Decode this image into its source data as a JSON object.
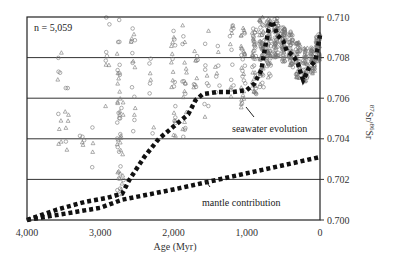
{
  "chart_data": {
    "type": "scatter",
    "title": "",
    "xlabel": "Age (Myr)",
    "ylabel": "87Sr/86Sr",
    "ylabel_display": {
      "sup1": "87",
      "base1": "Sr/",
      "sup2": "86",
      "base2": "Sr"
    },
    "x_reversed": true,
    "xlim": [
      4000,
      0
    ],
    "ylim": [
      0.7,
      0.71
    ],
    "x_ticks": [
      {
        "value": 4000,
        "label": "4,000"
      },
      {
        "value": 3000,
        "label": "3,000"
      },
      {
        "value": 2000,
        "label": "2,000"
      },
      {
        "value": 1000,
        "label": "1,000"
      },
      {
        "value": 0,
        "label": "0"
      }
    ],
    "y_ticks": [
      {
        "value": 0.7,
        "label": "0.700"
      },
      {
        "value": 0.702,
        "label": "0.702"
      },
      {
        "value": 0.704,
        "label": "0.704"
      },
      {
        "value": 0.706,
        "label": "0.706"
      },
      {
        "value": 0.708,
        "label": "0.708"
      },
      {
        "value": 0.71,
        "label": "0.710"
      }
    ],
    "y_axis_side": "right",
    "grid": "horizontal",
    "sample_count_label": "n = 5,059",
    "series": [
      {
        "name": "seawater evolution",
        "style": "thick-dotted",
        "color": "#111111",
        "points": [
          [
            4000,
            0.7
          ],
          [
            3600,
            0.7005
          ],
          [
            3200,
            0.7009
          ],
          [
            2900,
            0.7011
          ],
          [
            2700,
            0.7013
          ],
          [
            2600,
            0.702
          ],
          [
            2400,
            0.7031
          ],
          [
            2200,
            0.704
          ],
          [
            2000,
            0.7046
          ],
          [
            1800,
            0.7052
          ],
          [
            1700,
            0.7059
          ],
          [
            1600,
            0.7062
          ],
          [
            1400,
            0.7063
          ],
          [
            1200,
            0.7063
          ],
          [
            1000,
            0.7064
          ],
          [
            900,
            0.7067
          ],
          [
            800,
            0.7074
          ],
          [
            750,
            0.7085
          ],
          [
            700,
            0.7094
          ],
          [
            650,
            0.7098
          ],
          [
            580,
            0.7091
          ],
          [
            500,
            0.7088
          ],
          [
            450,
            0.7083
          ],
          [
            400,
            0.7082
          ],
          [
            350,
            0.708
          ],
          [
            300,
            0.7077
          ],
          [
            260,
            0.7072
          ],
          [
            230,
            0.7069
          ],
          [
            200,
            0.7071
          ],
          [
            150,
            0.7075
          ],
          [
            100,
            0.7077
          ],
          [
            60,
            0.7079
          ],
          [
            30,
            0.7085
          ],
          [
            0,
            0.7091
          ]
        ]
      },
      {
        "name": "mantle contribution",
        "style": "thick-dotted",
        "color": "#111111",
        "points": [
          [
            4000,
            0.7
          ],
          [
            3000,
            0.7006
          ],
          [
            2700,
            0.701
          ],
          [
            2000,
            0.7015
          ],
          [
            1500,
            0.7019
          ],
          [
            1000,
            0.7023
          ],
          [
            500,
            0.7027
          ],
          [
            0,
            0.7031
          ]
        ]
      }
    ],
    "scatter_groups": [
      {
        "marker": "circle",
        "color": "#777777",
        "label": "samples (open circles)"
      },
      {
        "marker": "triangle",
        "color": "#777777",
        "label": "samples (open triangles)"
      }
    ],
    "annotations": [
      {
        "text": "seawater evolution",
        "at": [
          700,
          0.7046
        ],
        "points_to": [
          800,
          0.7056
        ]
      },
      {
        "text": "mantle contribution",
        "at": [
          1600,
          0.701
        ],
        "points_to": [
          1900,
          0.7017
        ]
      }
    ]
  }
}
